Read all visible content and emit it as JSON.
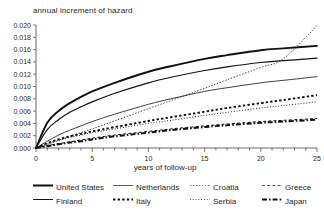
{
  "chart_data": {
    "type": "line",
    "title": "annual increment of hazard",
    "xlabel": "years of follow-up",
    "ylabel": "",
    "xlim": [
      0,
      25
    ],
    "ylim": [
      0.0,
      0.02
    ],
    "xticks": [
      0,
      5,
      10,
      15,
      20,
      25
    ],
    "xtick_labels": [
      "0",
      "5",
      "10",
      "15",
      "20",
      "25"
    ],
    "yticks": [
      0.0,
      0.002,
      0.004,
      0.006,
      0.008,
      0.01,
      0.012,
      0.014,
      0.016,
      0.018,
      0.02
    ],
    "ytick_labels": [
      "0.000",
      "0.002",
      "0.004",
      "0.006",
      "0.008",
      "0.010",
      "0.012",
      "0.014",
      "0.016",
      "0.018",
      "0.020"
    ],
    "grid": false,
    "legend_position": "bottom",
    "x": [
      0,
      1,
      2,
      3,
      4,
      5,
      7,
      10,
      12,
      15,
      17,
      20,
      22,
      25
    ],
    "series": [
      {
        "name": "United States",
        "style": "solid-thick",
        "color": "#111111",
        "values": [
          0.0,
          0.0041,
          0.006,
          0.0073,
          0.0083,
          0.0092,
          0.0106,
          0.0124,
          0.0133,
          0.0145,
          0.0151,
          0.0159,
          0.0162,
          0.0166
        ]
      },
      {
        "name": "Finland",
        "style": "solid",
        "color": "#111111",
        "values": [
          0.0,
          0.003,
          0.0046,
          0.0058,
          0.0067,
          0.0075,
          0.0089,
          0.0106,
          0.0115,
          0.0126,
          0.0132,
          0.0139,
          0.0142,
          0.0146
        ]
      },
      {
        "name": "Netherlands",
        "style": "solid-thin",
        "color": "#333333",
        "values": [
          0.0,
          0.0011,
          0.0021,
          0.0029,
          0.0036,
          0.0043,
          0.0055,
          0.0071,
          0.008,
          0.0092,
          0.0098,
          0.0106,
          0.011,
          0.0116
        ]
      },
      {
        "name": "Italy",
        "style": "dotted-square",
        "color": "#111111",
        "values": [
          0.0,
          0.0008,
          0.0014,
          0.0019,
          0.0023,
          0.0027,
          0.0034,
          0.0044,
          0.005,
          0.0059,
          0.0065,
          0.0073,
          0.0078,
          0.0086
        ]
      },
      {
        "name": "Croatia",
        "style": "dashed-fine",
        "color": "#555555",
        "values": [
          0.0,
          0.0006,
          0.0012,
          0.0019,
          0.0025,
          0.0031,
          0.0044,
          0.0064,
          0.0077,
          0.0097,
          0.0111,
          0.0131,
          0.0145,
          0.0199
        ]
      },
      {
        "name": "Serbia",
        "style": "dotted-fine",
        "color": "#444444",
        "values": [
          0.0,
          0.0007,
          0.0013,
          0.0017,
          0.0021,
          0.0025,
          0.0031,
          0.004,
          0.0045,
          0.0053,
          0.0058,
          0.0065,
          0.0069,
          0.0075
        ]
      },
      {
        "name": "Greece",
        "style": "dashed-short",
        "color": "#555555",
        "values": [
          0.0,
          0.0004,
          0.0007,
          0.001,
          0.0013,
          0.0016,
          0.0021,
          0.0027,
          0.0031,
          0.0036,
          0.0039,
          0.0043,
          0.0045,
          0.0048
        ]
      },
      {
        "name": "Japan",
        "style": "dash-dot-thick",
        "color": "#111111",
        "values": [
          0.0,
          0.0003,
          0.0006,
          0.0009,
          0.0011,
          0.0014,
          0.0019,
          0.0025,
          0.0029,
          0.0034,
          0.0037,
          0.0041,
          0.0043,
          0.0046
        ]
      }
    ]
  },
  "legend": {
    "items": [
      {
        "label": "United States",
        "style": "solid-thick"
      },
      {
        "label": "Finland",
        "style": "solid"
      },
      {
        "label": "Netherlands",
        "style": "solid-thin"
      },
      {
        "label": "Italy",
        "style": "dotted-square"
      },
      {
        "label": "Croatia",
        "style": "dashed-fine"
      },
      {
        "label": "Serbia",
        "style": "dotted-fine"
      },
      {
        "label": "Greece",
        "style": "dashed-short"
      },
      {
        "label": "Japan",
        "style": "dash-dot-thick"
      }
    ]
  }
}
